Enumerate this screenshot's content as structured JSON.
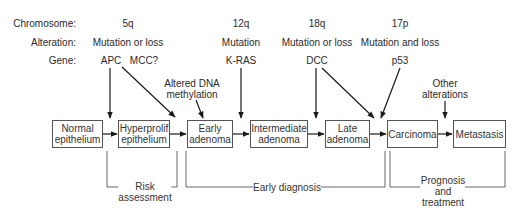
{
  "row_labels": {
    "chromosome": "Chromosome:",
    "alteration": "Alteration:",
    "gene": "Gene:"
  },
  "columns": [
    {
      "chromosome": "5q",
      "alteration": "Mutation or loss",
      "genes": [
        "APC",
        "MCC?"
      ]
    },
    {
      "chromosome": "12q",
      "alteration": "Mutation",
      "genes": [
        "K-RAS"
      ]
    },
    {
      "chromosome": "18q",
      "alteration": "Mutation or loss",
      "genes": [
        "DCC"
      ]
    },
    {
      "chromosome": "17p",
      "alteration": "Mutation and loss",
      "genes": [
        "p53"
      ]
    }
  ],
  "annotations": {
    "dna_methylation": [
      "Altered DNA",
      "methylation"
    ],
    "other_alterations": [
      "Other",
      "alterations"
    ]
  },
  "stages": [
    {
      "id": "normal",
      "lines": [
        "Normal",
        "epithelium"
      ]
    },
    {
      "id": "hyperprolif",
      "lines": [
        "Hyperprolif",
        "epithelium"
      ]
    },
    {
      "id": "early",
      "lines": [
        "Early",
        "adenoma"
      ]
    },
    {
      "id": "intermediate",
      "lines": [
        "Intermediate",
        "adenoma"
      ]
    },
    {
      "id": "late",
      "lines": [
        "Late",
        "adenoma"
      ]
    },
    {
      "id": "carcinoma",
      "lines": [
        "Carcinoma"
      ]
    },
    {
      "id": "metastasis",
      "lines": [
        "Metastasis"
      ]
    }
  ],
  "brackets": [
    {
      "id": "risk",
      "lines": [
        "Risk",
        "assessment"
      ]
    },
    {
      "id": "early-diagnosis",
      "lines": [
        "Early diagnosis"
      ]
    },
    {
      "id": "prognosis",
      "lines": [
        "Prognosis",
        "and",
        "treatment"
      ]
    }
  ],
  "colors": {
    "line": "#1a1a1a",
    "bracket": "#666666",
    "text": "#2a2a2a"
  }
}
